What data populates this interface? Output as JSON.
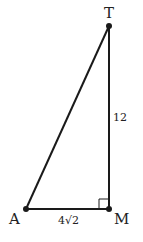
{
  "diagram": {
    "type": "right-triangle",
    "points": {
      "T": {
        "label": "T",
        "x": 109,
        "y": 26
      },
      "M": {
        "label": "M",
        "x": 109,
        "y": 209
      },
      "A": {
        "label": "A",
        "x": 26,
        "y": 209
      }
    },
    "segments": [
      {
        "from": "A",
        "to": "T"
      },
      {
        "from": "T",
        "to": "M",
        "length_label": "12"
      },
      {
        "from": "A",
        "to": "M",
        "length_label": "4√2"
      }
    ],
    "right_angle_at": "M",
    "colors": {
      "stroke": "#1a1a1a",
      "text": "#222222",
      "background": "#ffffff"
    }
  }
}
